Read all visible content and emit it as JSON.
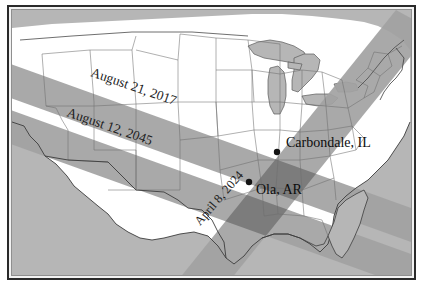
{
  "figure": {
    "type": "map",
    "background_color": "#bdbdbd",
    "land_color": "#ffffff",
    "water_color": "#b6b6b6",
    "border_color": "#2a2a2a",
    "band_color": "#a2a2a2",
    "band_overlap_color": "#6f6f6f",
    "state_line_color": "#6e6e6e",
    "coast_line_color": "#3c3c3c"
  },
  "eclipse_paths": [
    {
      "id": "path-2017",
      "label": "August 21, 2017",
      "date": "August 21, 2017",
      "direction": "northwest-to-southeast",
      "label_rotation_deg": 19,
      "label_x": 78,
      "label_y": 66,
      "color": "#a2a2a2"
    },
    {
      "id": "path-2045",
      "label": "August 12, 2045",
      "date": "August 12, 2045",
      "direction": "northwest-to-southeast",
      "label_rotation_deg": 19,
      "label_x": 54,
      "label_y": 106,
      "color": "#a2a2a2"
    },
    {
      "id": "path-2024",
      "label": "April 8, 2024",
      "date": "April 8, 2024",
      "direction": "southwest-to-northeast",
      "label_rotation_deg": -49,
      "label_x": 188,
      "label_y": 216,
      "color": "#a2a2a2"
    }
  ],
  "cities": [
    {
      "id": "carbondale",
      "label": "Carbondale, IL",
      "name": "Carbondale",
      "state": "IL",
      "marker_x": 265,
      "marker_y": 142,
      "label_x": 274,
      "label_y": 137
    },
    {
      "id": "ola",
      "label": "Ola, AR",
      "name": "Ola",
      "state": "AR",
      "marker_x": 237,
      "marker_y": 172,
      "label_x": 244,
      "label_y": 184
    }
  ]
}
